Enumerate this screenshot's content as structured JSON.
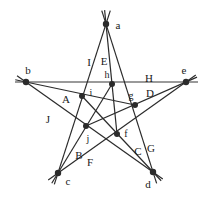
{
  "figure": {
    "type": "pentagram-star-diagram",
    "title": "",
    "width": 211,
    "height": 198,
    "background_color": "#ffffff",
    "stroke_color": "#2b2b2b",
    "node_color": "#2b2b2b",
    "highlight_line_color": "#9a9a9a",
    "label_color": "#1a1a1a"
  },
  "outer_vertices": [
    {
      "id": "a",
      "label": "a",
      "x": 106,
      "y": 24,
      "label_x": 118,
      "label_y": 25
    },
    {
      "id": "b",
      "label": "b",
      "x": 26,
      "y": 82,
      "label_x": 28,
      "label_y": 70
    },
    {
      "id": "e",
      "label": "e",
      "x": 186,
      "y": 82,
      "label_x": 184,
      "label_y": 70
    },
    {
      "id": "c",
      "label": "c",
      "x": 58,
      "y": 173,
      "label_x": 68,
      "label_y": 181
    },
    {
      "id": "d",
      "label": "d",
      "x": 153,
      "y": 172,
      "label_x": 148,
      "label_y": 184
    }
  ],
  "inner_vertices": [
    {
      "id": "h",
      "label": "h",
      "x": 112,
      "y": 84,
      "label_x": 107,
      "label_y": 75
    },
    {
      "id": "i",
      "label": "i",
      "x": 82,
      "y": 96,
      "label_x": 91,
      "label_y": 93
    },
    {
      "id": "g",
      "label": "g",
      "x": 135,
      "y": 105,
      "label_x": 131,
      "label_y": 96
    },
    {
      "id": "f",
      "label": "f",
      "x": 117,
      "y": 134,
      "label_x": 126,
      "label_y": 134
    },
    {
      "id": "j",
      "label": "j",
      "x": 86,
      "y": 126,
      "label_x": 88,
      "label_y": 139
    }
  ],
  "edge_labels": [
    {
      "id": "A",
      "label": "A",
      "x": 66,
      "y": 99
    },
    {
      "id": "B",
      "label": "B",
      "x": 79,
      "y": 155
    },
    {
      "id": "C",
      "label": "C",
      "x": 138,
      "y": 151
    },
    {
      "id": "D",
      "label": "D",
      "x": 150,
      "y": 93
    },
    {
      "id": "E",
      "label": "E",
      "x": 104,
      "y": 61
    },
    {
      "id": "F",
      "label": "F",
      "x": 90,
      "y": 162
    },
    {
      "id": "G",
      "label": "G",
      "x": 151,
      "y": 148
    },
    {
      "id": "H",
      "label": "H",
      "x": 149,
      "y": 78
    },
    {
      "id": "I",
      "label": "I",
      "x": 89,
      "y": 62
    },
    {
      "id": "J",
      "label": "J",
      "x": 48,
      "y": 119
    }
  ],
  "lines": [
    {
      "id": "line-b-e",
      "from": "b",
      "to": "e",
      "label": "H",
      "highlighted": true
    },
    {
      "id": "line-a-c",
      "from": "a",
      "to": "c",
      "label": "I",
      "highlighted": false
    },
    {
      "id": "line-a-d",
      "from": "a",
      "to": "d",
      "label": "E",
      "highlighted": false
    },
    {
      "id": "line-b-d",
      "from": "b",
      "to": "d",
      "label": "J",
      "highlighted": false
    },
    {
      "id": "line-c-e",
      "from": "c",
      "to": "e",
      "label": "F",
      "highlighted": false
    },
    {
      "id": "line-a-f",
      "from": "a",
      "to": "f",
      "label": "",
      "highlighted": false
    },
    {
      "id": "line-b-g",
      "from": "b",
      "to": "g",
      "label": "A",
      "highlighted": false
    },
    {
      "id": "line-c-h",
      "from": "c",
      "to": "h",
      "label": "B",
      "highlighted": false
    },
    {
      "id": "line-d-i",
      "from": "d",
      "to": "i",
      "label": "C",
      "highlighted": false
    },
    {
      "id": "line-e-j",
      "from": "e",
      "to": "j",
      "label": "D",
      "highlighted": false
    }
  ],
  "overshoot": {
    "a": 14,
    "b": 11,
    "c": 12,
    "d": 12,
    "e": 12
  }
}
